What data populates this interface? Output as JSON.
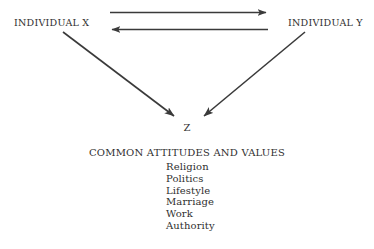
{
  "diagram": {
    "title_internal": "interpersonal-attraction-diagram",
    "stroke_color": "#3a3a3a",
    "background_color": "#ffffff",
    "nodes": {
      "individual_x": "INDIVIDUAL X",
      "individual_y": "INDIVIDUAL Y",
      "z": "Z"
    },
    "arrows": [
      {
        "name": "x-to-y-arrow",
        "direction": "right",
        "from": "INDIVIDUAL X",
        "to": "INDIVIDUAL Y"
      },
      {
        "name": "y-to-x-arrow",
        "direction": "left",
        "from": "INDIVIDUAL Y",
        "to": "INDIVIDUAL X"
      },
      {
        "name": "x-to-z-arrow",
        "direction": "down-right",
        "from": "INDIVIDUAL X",
        "to": "Z"
      },
      {
        "name": "y-to-z-arrow",
        "direction": "down-left",
        "from": "INDIVIDUAL Y",
        "to": "Z"
      }
    ]
  },
  "values": {
    "heading": "COMMON ATTITUDES AND VALUES",
    "items": [
      "Religion",
      "Politics",
      "Lifestyle",
      "Marriage",
      "Work",
      "Authority"
    ]
  }
}
